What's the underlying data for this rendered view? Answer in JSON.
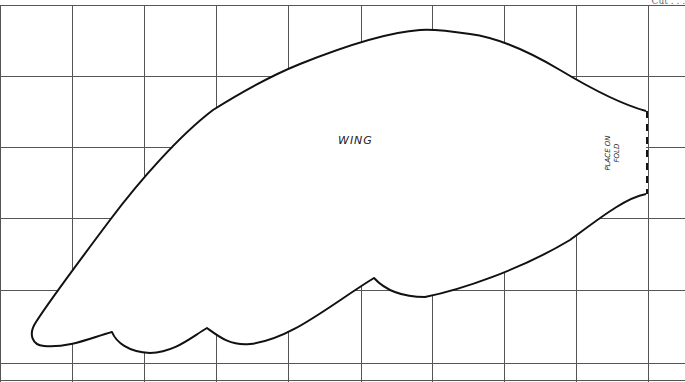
{
  "pattern": {
    "piece_label": "WING",
    "fold_label_line1": "PLACE ON",
    "fold_label_line2": "FOLD",
    "corner_text": "Cut . . .",
    "grid": {
      "vertical_lines_x": [
        0,
        72,
        144,
        216,
        288,
        361,
        432,
        504,
        576,
        648
      ],
      "horizontal_lines_y": [
        5,
        76,
        147,
        218,
        290,
        363,
        380
      ],
      "color": "#555555"
    },
    "outline_color": "#111111",
    "fold_line_style": "dashed"
  }
}
